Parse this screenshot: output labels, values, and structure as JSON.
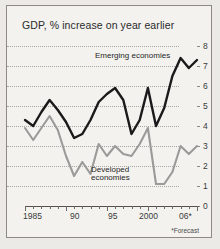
{
  "chart_data": {
    "type": "line",
    "title": "GDP, % increase on year earlier",
    "xlabel": "",
    "ylabel": "",
    "ylim": [
      0,
      8
    ],
    "xlim": [
      1985,
      2006
    ],
    "grid": true,
    "gridlines": [
      1,
      2,
      3,
      4,
      5,
      6,
      7,
      8
    ],
    "yticks": [
      "0",
      "1",
      "2",
      "3",
      "4",
      "5",
      "6",
      "7",
      "8"
    ],
    "xticks": [
      "1985",
      "90",
      "95",
      "2000",
      "06*"
    ],
    "xtick_years": [
      1985,
      1990,
      1995,
      2000,
      2006
    ],
    "legend_position": "inline-annotation",
    "footnote": "*Forecast",
    "x": [
      1985,
      1986,
      1987,
      1988,
      1989,
      1990,
      1991,
      1992,
      1993,
      1994,
      1995,
      1996,
      1997,
      1998,
      1999,
      2000,
      2001,
      2002,
      2003,
      2004,
      2005,
      2006
    ],
    "series": [
      {
        "name": "Emerging economies",
        "color": "#1a1a1a",
        "values": [
          4.3,
          4.0,
          4.7,
          5.3,
          4.8,
          4.2,
          3.4,
          3.6,
          4.3,
          5.2,
          5.6,
          5.9,
          5.3,
          3.6,
          4.3,
          5.9,
          4.0,
          4.9,
          6.5,
          7.4,
          6.9,
          7.3
        ]
      },
      {
        "name": "Developed economies",
        "color": "#9a9a98",
        "values": [
          3.9,
          3.3,
          3.9,
          4.5,
          3.8,
          2.5,
          1.5,
          2.2,
          1.6,
          3.1,
          2.5,
          3.0,
          2.6,
          2.5,
          3.1,
          3.9,
          1.1,
          1.1,
          1.7,
          3.0,
          2.6,
          3.0
        ]
      }
    ],
    "annotations": [
      {
        "text": "Emerging economies",
        "target": "series-0"
      },
      {
        "text": "Developed economies",
        "target": "series-1"
      }
    ]
  },
  "chart": {
    "title": "GDP, % increase on year earlier",
    "footnote": "*Forecast",
    "label_emerging": "Emerging economies",
    "label_developed_line1": "Developed",
    "label_developed_line2": "economies",
    "y_labels": [
      "8",
      "7",
      "6",
      "5",
      "4",
      "3",
      "2",
      "1",
      "0"
    ],
    "x_labels": [
      "1985",
      "90",
      "95",
      "2000",
      "06*"
    ],
    "colors": {
      "emerging": "#1a1a1a",
      "developed": "#9a9a98",
      "background": "#f3f2ef",
      "border": "#8d8a86",
      "grid": "#a8a6a2",
      "axis": "#55524e"
    }
  }
}
